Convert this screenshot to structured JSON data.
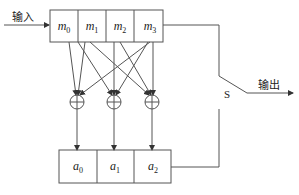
{
  "diagram": {
    "input_label": "输入",
    "output_label": "输出",
    "switch_label": "S",
    "top_register": {
      "cells": [
        {
          "var": "m",
          "sub": "0"
        },
        {
          "var": "m",
          "sub": "1"
        },
        {
          "var": "m",
          "sub": "2"
        },
        {
          "var": "m",
          "sub": "3"
        }
      ]
    },
    "bottom_register": {
      "cells": [
        {
          "var": "a",
          "sub": "0"
        },
        {
          "var": "a",
          "sub": "1"
        },
        {
          "var": "a",
          "sub": "2"
        }
      ]
    },
    "adders": [
      {
        "symbol": "⊕",
        "index": 0
      },
      {
        "symbol": "⊕",
        "index": 1
      },
      {
        "symbol": "⊕",
        "index": 2
      }
    ],
    "line_color": "#555555"
  }
}
